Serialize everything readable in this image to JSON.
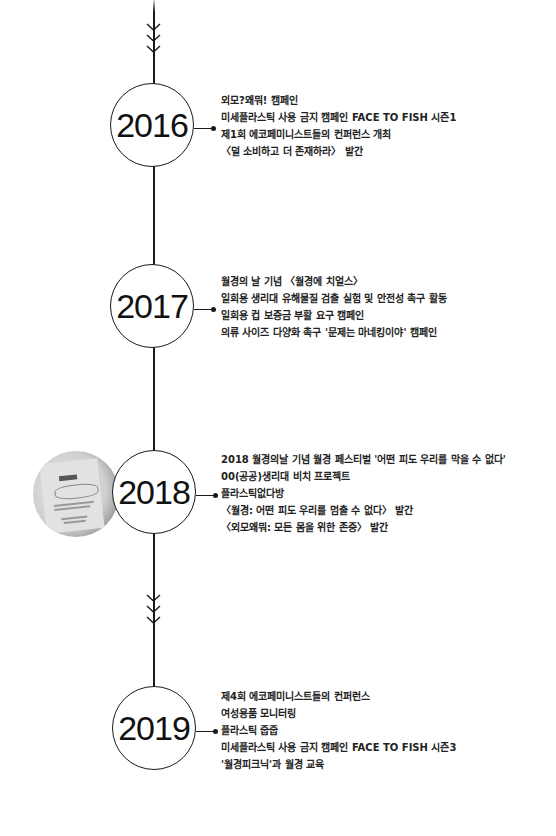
{
  "timeline": {
    "line_color": "#1a1a1a",
    "entries": [
      {
        "year": "2016",
        "items": [
          "외모?왜뭐! 캠페인",
          "미세플라스틱 사용 금지 캠페인 FACE TO FISH 시즌1",
          "제1회 에코페미니스트들의 컨퍼런스 개최",
          "〈덜 소비하고 더 존재하라〉 발간"
        ]
      },
      {
        "year": "2017",
        "items": [
          "월경의 날 기념 〈월경에 치얼스〉",
          "일회용 생리대 유해물질 검출 실험 및 안전성 촉구 활동",
          "일회용 컵 보증금 부활 요구 캠페인",
          "의류 사이즈 다양화 촉구 '문제는 마네킹이야' 캠페인"
        ]
      },
      {
        "year": "2018",
        "photo": "product-photo",
        "items": [
          "2018 월경의날 기념 월경 페스티벌 '어떤 피도 우리를 막을 수 없다'",
          "00(공공)생리대 비치 프로젝트",
          "플라스틱없다방",
          "〈월경: 어떤 피도 우리를 멈출 수 없다〉 발간",
          "〈외모왜뭐: 모든 몸을 위한 존중〉 발간"
        ]
      },
      {
        "year": "2019",
        "items": [
          "제4회 에코페미니스트들의 컨퍼런스",
          "여성용품 모니터링",
          "플라스틱 줍줍",
          "미세플라스틱 사용 금지 캠페인 FACE TO FISH 시즌3",
          "'월경피크닉'과 월경 교육"
        ]
      }
    ]
  }
}
